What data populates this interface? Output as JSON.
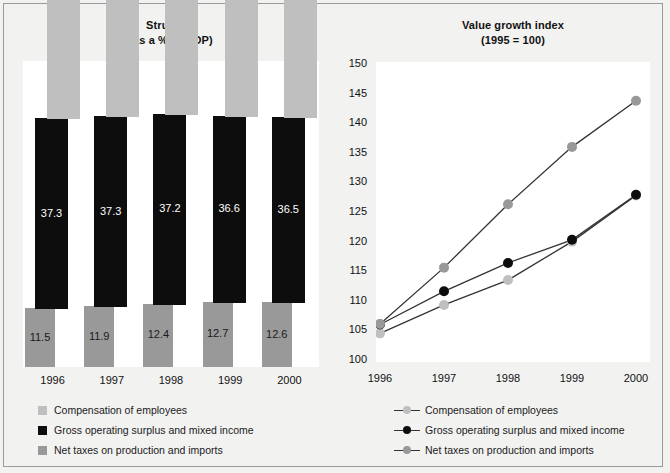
{
  "figure": {
    "background": "#f2f2f1",
    "border_color": "#9a9a9a"
  },
  "colors": {
    "compensation": "#bfbfbf",
    "gross_operating_surplus": "#0d0d0d",
    "net_taxes": "#999999",
    "plot_background": "#ffffff",
    "line": "#333333"
  },
  "left_chart": {
    "title_line1": "Structure",
    "title_line2": "(as a % of GDP)",
    "x_labels": [
      "1996",
      "1997",
      "1998",
      "1999",
      "2000"
    ],
    "legend": [
      {
        "label": "Compensation of employees",
        "color": "#bfbfbf"
      },
      {
        "label": "Gross operating surplus and mixed income",
        "color": "#0d0d0d"
      },
      {
        "label": "Net taxes on production and imports",
        "color": "#999999"
      }
    ]
  },
  "right_chart": {
    "title_line1": "Value growth index",
    "title_line2": "(1995 = 100)",
    "y_ticks": [
      "150",
      "145",
      "140",
      "135",
      "130",
      "125",
      "120",
      "115",
      "110",
      "105",
      "100"
    ],
    "x_labels": [
      "1996",
      "1997",
      "1998",
      "1999",
      "2000"
    ],
    "legend": [
      {
        "label": "Compensation of employees",
        "color": "#bfbfbf"
      },
      {
        "label": "Gross operating surplus and mixed income",
        "color": "#0d0d0d"
      },
      {
        "label": "Net taxes on production and imports",
        "color": "#999999"
      }
    ]
  },
  "chart_data": [
    {
      "type": "bar",
      "title": "Structure (as a % of GDP)",
      "xlabel": "",
      "ylabel": "% of GDP",
      "categories": [
        "1996",
        "1997",
        "1998",
        "1999",
        "2000"
      ],
      "grid": false,
      "legend_position": "below",
      "stacked_offset": true,
      "series": [
        {
          "name": "Compensation of employees",
          "color": "#bfbfbf",
          "values": [
            51.2,
            50.8,
            50.4,
            50.7,
            50.9
          ]
        },
        {
          "name": "Gross operating surplus and mixed income",
          "color": "#0d0d0d",
          "values": [
            37.3,
            37.3,
            37.2,
            36.6,
            36.5
          ]
        },
        {
          "name": "Net taxes on production and imports",
          "color": "#999999",
          "values": [
            11.5,
            11.9,
            12.4,
            12.7,
            12.6
          ]
        }
      ]
    },
    {
      "type": "line",
      "title": "Value growth index (1995 = 100)",
      "xlabel": "",
      "ylabel": "Index (1995 = 100)",
      "x": [
        "1996",
        "1997",
        "1998",
        "1999",
        "2000"
      ],
      "ylim": [
        100,
        150
      ],
      "ytick_step": 5,
      "grid": false,
      "legend_position": "below",
      "series": [
        {
          "name": "Compensation of employees",
          "color": "#bfbfbf",
          "values": [
            104.5,
            109.3,
            113.5,
            120.0,
            127.8
          ]
        },
        {
          "name": "Gross operating surplus and mixed income",
          "color": "#0d0d0d",
          "values": [
            106.0,
            111.6,
            116.4,
            120.3,
            127.9
          ]
        },
        {
          "name": "Net taxes on production and imports",
          "color": "#999999",
          "values": [
            106.1,
            115.6,
            126.3,
            136.0,
            143.8
          ]
        }
      ]
    }
  ]
}
